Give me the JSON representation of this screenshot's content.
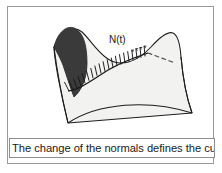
{
  "figure": {
    "caption": "The change of the normals defines the curvature",
    "annotations": {
      "normal_field_label": "N(t)"
    },
    "colors": {
      "frame_border": "#9a9a9a",
      "caption_border": "#8e8e8e",
      "surface_fill": "#f2f2f0",
      "surface_stroke": "#1d1d1d",
      "shaded_fold_fill": "#3a3a3a",
      "curve_stroke": "#161616",
      "normal_arrow_stroke": "#171717",
      "dashed_line_stroke": "#4a4a4a",
      "background": "#ffffff",
      "text": "#1b1b1b"
    },
    "elements": {
      "surface_name": "saddle-surface",
      "shaded_region_name": "shaded-fold",
      "curve_name": "surface-curve",
      "normals_name": "normal-vector-field",
      "dashed_name": "tangent-dashed-line"
    }
  }
}
